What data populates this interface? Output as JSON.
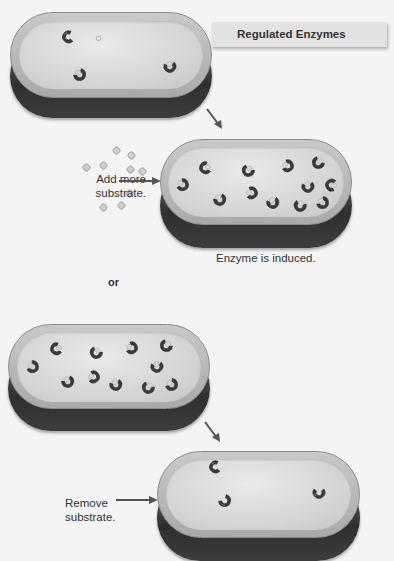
{
  "title": "Regulated Enzymes",
  "step1": {
    "action_label_line1": "Add more",
    "action_label_line2": "substrate.",
    "result_caption": "Enzyme is induced."
  },
  "separator": "or",
  "step2": {
    "action_label_line1": "Remove",
    "action_label_line2": "substrate."
  },
  "colors": {
    "background": "#f4f4f4",
    "cell_rim": "#a9a9a9",
    "cell_interior": "#e0e0e0",
    "cell_base": "#2f2f2f",
    "enzyme": "#3a3a3a",
    "substrate": "#cfcfcf",
    "arrow": "#555555",
    "label_box": "#e2e2e2"
  },
  "cells": [
    {
      "name": "initial-cell",
      "enzyme_count": 3
    },
    {
      "name": "induced-cell",
      "enzyme_count": 12
    },
    {
      "name": "high-enzyme-cell",
      "enzyme_count": 12
    },
    {
      "name": "repressed-cell",
      "enzyme_count": 3
    }
  ]
}
